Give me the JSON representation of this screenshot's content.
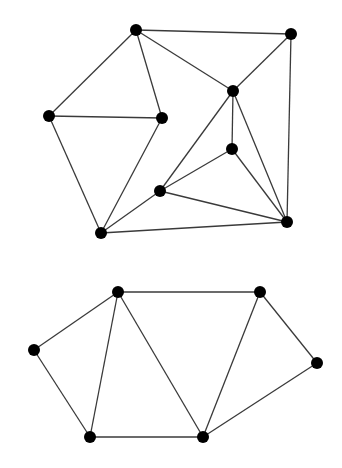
{
  "diagram": {
    "type": "undirected-graphs",
    "colors": {
      "node": "#000000",
      "edge": "#3a3a3a",
      "background": "#ffffff"
    },
    "graphs": [
      {
        "id": "graph-top",
        "nodes": [
          {
            "id": "A"
          },
          {
            "id": "B"
          },
          {
            "id": "C"
          },
          {
            "id": "D"
          },
          {
            "id": "E"
          },
          {
            "id": "F"
          },
          {
            "id": "G"
          },
          {
            "id": "H"
          },
          {
            "id": "I"
          }
        ],
        "edges": [
          [
            "A",
            "B"
          ],
          [
            "A",
            "D"
          ],
          [
            "A",
            "E"
          ],
          [
            "A",
            "C"
          ],
          [
            "B",
            "C"
          ],
          [
            "B",
            "I"
          ],
          [
            "D",
            "E"
          ],
          [
            "D",
            "H"
          ],
          [
            "E",
            "H"
          ],
          [
            "C",
            "G"
          ],
          [
            "C",
            "F"
          ],
          [
            "C",
            "I"
          ],
          [
            "F",
            "G"
          ],
          [
            "F",
            "I"
          ],
          [
            "G",
            "H"
          ],
          [
            "G",
            "I"
          ],
          [
            "H",
            "I"
          ]
        ]
      },
      {
        "id": "graph-bottom",
        "nodes": [
          {
            "id": "P"
          },
          {
            "id": "Q"
          },
          {
            "id": "R"
          },
          {
            "id": "S"
          },
          {
            "id": "T"
          },
          {
            "id": "U"
          }
        ],
        "edges": [
          [
            "P",
            "Q"
          ],
          [
            "P",
            "R"
          ],
          [
            "P",
            "T"
          ],
          [
            "P",
            "U"
          ],
          [
            "R",
            "T"
          ],
          [
            "T",
            "U"
          ],
          [
            "Q",
            "U"
          ],
          [
            "Q",
            "S"
          ],
          [
            "U",
            "S"
          ]
        ]
      }
    ]
  }
}
